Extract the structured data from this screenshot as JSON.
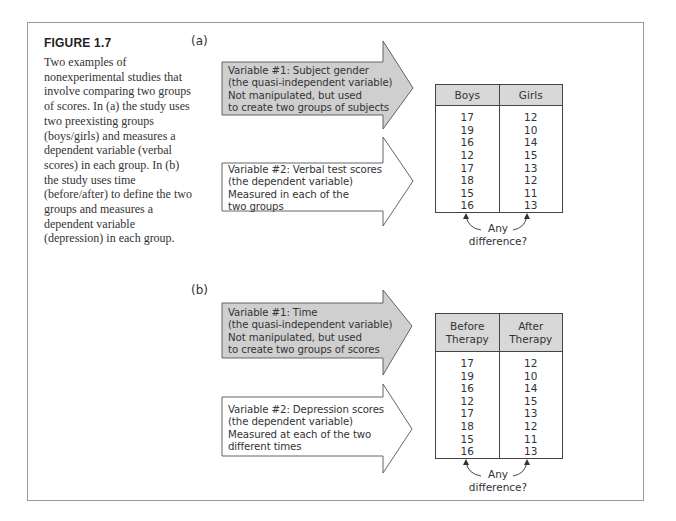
{
  "figure": {
    "title": "FIGURE 1.7",
    "caption": "Two examples of nonexperimental studies that involve comparing two groups of scores. In (a) the study uses two preexisting groups (boys/girls) and measures a dependent variable (verbal scores) in each group. In (b) the study uses time (before/after) to define the two groups and measures a dependent variable (depression) in each group."
  },
  "panel_a": {
    "label": "(a)",
    "var1": {
      "lines": [
        "Variable #1: Subject gender",
        "(the quasi-independent variable)",
        "Not manipulated, but used",
        "to create two groups of subjects"
      ]
    },
    "var2": {
      "lines": [
        "Variable #2: Verbal test scores",
        "(the dependent variable)",
        "Measured in each of the",
        "two groups"
      ]
    },
    "table": {
      "headers": [
        "Boys",
        "Girls"
      ],
      "columns": [
        [
          "17",
          "19",
          "16",
          "12",
          "17",
          "18",
          "15",
          "16"
        ],
        [
          "12",
          "10",
          "14",
          "15",
          "13",
          "12",
          "11",
          "13"
        ]
      ]
    },
    "difference_label": [
      "Any",
      "difference?"
    ]
  },
  "panel_b": {
    "label": "(b)",
    "var1": {
      "lines": [
        "Variable #1: Time",
        "(the quasi-independent variable)",
        "Not manipulated, but used",
        "to create two groups of scores"
      ]
    },
    "var2": {
      "lines": [
        "Variable #2: Depression scores",
        "(the dependent variable)",
        "Measured at each of the two",
        "different times"
      ]
    },
    "table": {
      "headers": [
        "Before Therapy",
        "After Therapy"
      ],
      "header_lines": [
        [
          "Before",
          "Therapy"
        ],
        [
          "After",
          "Therapy"
        ]
      ],
      "columns": [
        [
          "17",
          "19",
          "16",
          "12",
          "17",
          "18",
          "15",
          "16"
        ],
        [
          "12",
          "10",
          "14",
          "15",
          "13",
          "12",
          "11",
          "13"
        ]
      ]
    },
    "difference_label": [
      "Any",
      "difference?"
    ]
  },
  "colors": {
    "frame": "#9a9a9a",
    "arrow_fill_independent": "#cfcfcf",
    "arrow_fill_dependent": "#ffffff",
    "table_header_fill": "#d8d8d8",
    "text": "#333333"
  }
}
